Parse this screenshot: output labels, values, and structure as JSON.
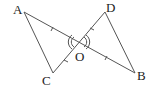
{
  "diagram": {
    "labels": {
      "A": "A",
      "B": "B",
      "C": "C",
      "D": "D",
      "O": "O"
    },
    "points": {
      "A": [
        24,
        12
      ],
      "B": [
        135,
        73
      ],
      "C": [
        53,
        73
      ],
      "D": [
        105,
        12
      ],
      "O": [
        79,
        42
      ]
    },
    "segments": [
      "AC",
      "AB",
      "CD",
      "DB"
    ],
    "equal_marks": [
      "AO=OB",
      "CO=OD"
    ],
    "angle_marks": [
      "AOC",
      "DOB"
    ],
    "stroke_color": "#555555"
  }
}
